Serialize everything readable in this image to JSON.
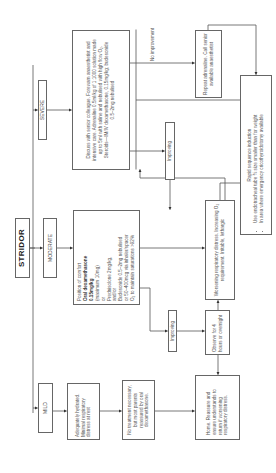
{
  "diagram": {
    "root": "STRIDOR",
    "severities": {
      "severe": "SEVERE",
      "moderate": "MODERATE",
      "mild": "MILD"
    },
    "severe_box": {
      "text": "Discuss with senior colleague. Forewarn anaesthetist and intensive care. Adrenaline 0.5ml/kg of 1:1000 solution made up to 5ml with saline and nebulised with high flow O₂. Steroids—IM/IV dexamethasone, 0.15mg/kg; budesonide 0.5–2mg nebulised"
    },
    "moderate_box": {
      "line1": "Position of comfort",
      "bold1": "Oral dexamethasone",
      "bold2": "0.15mg/kg",
      "line2": "(maximum 10mg)",
      "line3": "or",
      "line4": "Prednisolone 2mg/kg,",
      "line5": "and/or",
      "line6": "Budesonide 0.5–2mg nebulised",
      "line7": "or 50–400mcg via inhaler/spacer",
      "line8": "O₂ to maintain saturations >92%"
    },
    "mild_box": {
      "text": "Adequately hydrated. Minimal respiratory distress at rest"
    },
    "no_treatment_box": {
      "text": "No treatment necessary, but most parents reassured by oral dexamethasone."
    },
    "improving_upper": "Improving",
    "improving_lower": "Improving",
    "no_improvement_label": "No improvement",
    "repeat_box": {
      "text": "Repeat adrenaline. Call senior available anaesthetist"
    },
    "worsening_box": {
      "text": "Worsening respiratory distress. Increasing O₂ requirement. Irritable, lethargic"
    },
    "observe_box": {
      "text": "Observe for 4 hours or overnight"
    },
    "home_box": {
      "text": "Home. Reassure and ensure understands to return if worsening respiratory distress."
    },
    "rsi_box": {
      "title": "Rapid sequence induction",
      "bullets": [
        "Use endotracheal tube ½ size smaller than for weight",
        "In area where emergency cricothyroidotomy available"
      ]
    }
  },
  "colors": {
    "line": "#555555",
    "border": "#666666",
    "text": "#555555"
  }
}
